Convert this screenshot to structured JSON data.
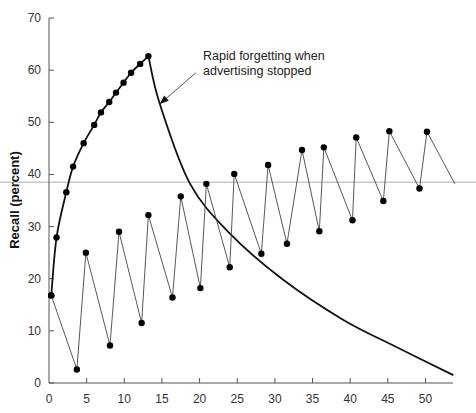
{
  "chart_data": {
    "type": "line",
    "title": "",
    "xlabel": "",
    "ylabel": "Recall (percent)",
    "xlim": [
      0,
      54
    ],
    "ylim": [
      0,
      70
    ],
    "xticks": [
      0,
      5,
      10,
      15,
      20,
      25,
      30,
      35,
      40,
      45,
      50
    ],
    "yticks": [
      0,
      10,
      20,
      30,
      40,
      50,
      60,
      70
    ],
    "grid": false,
    "reference_line": {
      "y": 38.5,
      "color": "#c8c8c8"
    },
    "annotation": {
      "lines": [
        "Rapid forgetting when",
        "advertising stopped"
      ],
      "arrow_from": [
        19.5,
        59.5
      ],
      "arrow_to": [
        14.7,
        53.5
      ]
    },
    "series": [
      {
        "name": "Weekly advertising (13 weeks)",
        "style": "thick curve with markers",
        "points": [
          [
            0.3,
            16.8
          ],
          [
            1,
            27.9
          ],
          [
            2.3,
            36.6
          ],
          [
            3.2,
            41.5
          ],
          [
            4.6,
            46.0
          ],
          [
            6.0,
            49.5
          ],
          [
            6.9,
            51.9
          ],
          [
            8.0,
            53.9
          ],
          [
            8.9,
            55.7
          ],
          [
            9.9,
            57.6
          ],
          [
            10.9,
            59.5
          ],
          [
            12.1,
            61.2
          ],
          [
            13.2,
            62.7
          ]
        ]
      },
      {
        "name": "Forgetting after advertising stopped",
        "style": "thick curve, no markers",
        "points": [
          [
            13.2,
            62.7
          ],
          [
            14.7,
            53.6
          ],
          [
            18.7,
            38.3
          ],
          [
            24.0,
            28.7
          ],
          [
            31.1,
            19.8
          ],
          [
            39.1,
            12.1
          ],
          [
            46.0,
            7.0
          ],
          [
            53.7,
            1.5
          ]
        ]
      },
      {
        "name": "Advertising every 4 weeks",
        "style": "thin zigzag with markers",
        "points": [
          [
            0.3,
            16.8
          ],
          [
            3.7,
            2.6
          ],
          [
            4.9,
            25.0
          ],
          [
            8.1,
            7.2
          ],
          [
            9.3,
            29.0
          ],
          [
            12.3,
            11.5
          ],
          [
            13.2,
            32.2
          ],
          [
            16.4,
            16.4
          ],
          [
            17.5,
            35.8
          ],
          [
            20.1,
            18.2
          ],
          [
            20.9,
            38.2
          ],
          [
            24.0,
            22.2
          ],
          [
            24.6,
            40.1
          ],
          [
            28.2,
            24.8
          ],
          [
            29.1,
            41.8
          ],
          [
            31.6,
            26.7
          ],
          [
            33.6,
            44.7
          ],
          [
            35.9,
            29.1
          ],
          [
            36.5,
            45.2
          ],
          [
            40.3,
            31.2
          ],
          [
            40.8,
            47.1
          ],
          [
            44.4,
            34.9
          ],
          [
            45.2,
            48.3
          ],
          [
            49.2,
            37.3
          ],
          [
            50.2,
            48.2
          ],
          [
            53.9,
            38.2
          ]
        ],
        "markers_exclude_last": true
      }
    ]
  }
}
